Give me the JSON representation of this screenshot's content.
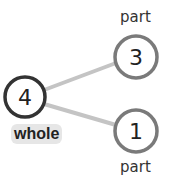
{
  "diagram": {
    "type": "number-bond",
    "whole": {
      "value": "4",
      "label": "whole"
    },
    "parts": [
      {
        "value": "3",
        "label": "part"
      },
      {
        "value": "1",
        "label": "part"
      }
    ],
    "colors": {
      "whole_stroke": "#333333",
      "part_stroke": "#7a7a7a",
      "connector": "#bdbdbd",
      "label_bg": "#e6e6e6"
    }
  }
}
